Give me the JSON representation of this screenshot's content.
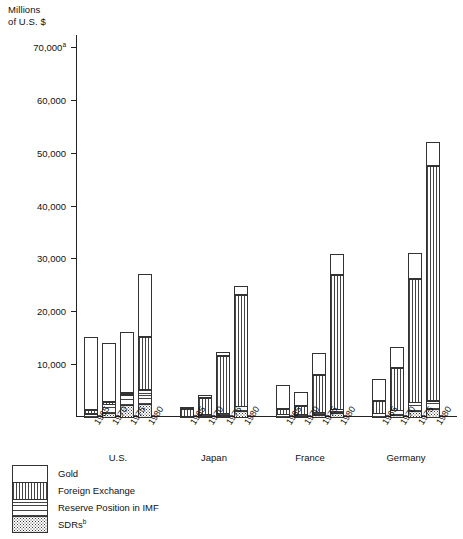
{
  "chart_data": {
    "type": "bar",
    "subtype": "stacked-grouped",
    "title": "",
    "ylabel": "Millions\nof U.S. $",
    "xlabel": "",
    "ylim": [
      0,
      70000
    ],
    "ytick_labels": [
      "70,000",
      "60,000",
      "50,000",
      "40,000",
      "30,000",
      "20,000",
      "10,000"
    ],
    "ytick_values": [
      70000,
      60000,
      50000,
      40000,
      30000,
      20000,
      10000
    ],
    "ytick_footnote": "a",
    "grid": false,
    "legend_position": "below-left",
    "categories": [
      "U.S.",
      "Japan",
      "France",
      "Germany",
      "U.K."
    ],
    "years": [
      "1965",
      "1970",
      "1975",
      "1980"
    ],
    "series": [
      {
        "name": "Gold",
        "pattern": "solid-white"
      },
      {
        "name": "Foreign Exchange",
        "pattern": "vertical-lines"
      },
      {
        "name": "Reserve Position in IMF",
        "pattern": "horizontal-lines"
      },
      {
        "name": "SDRs",
        "pattern": "dotted",
        "footnote": "b"
      }
    ],
    "groups": [
      {
        "country": "U.S.",
        "bars": [
          {
            "year": "1965",
            "total": 15450,
            "segments": {
              "SDRs": 0,
              "Reserve Position in IMF": 800,
              "Foreign Exchange": 750,
              "Gold": 13900
            }
          },
          {
            "year": "1970",
            "total": 14490,
            "segments": {
              "SDRs": 850,
              "Reserve Position in IMF": 1900,
              "Foreign Exchange": 600,
              "Gold": 11140
            }
          },
          {
            "year": "1975",
            "total": 16230,
            "segments": {
              "SDRs": 2340,
              "Reserve Position in IMF": 2200,
              "Foreign Exchange": 100,
              "Gold": 11590
            }
          },
          {
            "year": "1980",
            "total": 27400,
            "segments": {
              "SDRs": 2610,
              "Reserve Position in IMF": 2850,
              "Foreign Exchange": 10100,
              "Gold": 11840
            }
          }
        ]
      },
      {
        "country": "Japan",
        "bars": [
          {
            "year": "1965",
            "total": 2110,
            "segments": {
              "SDRs": 0,
              "Reserve Position in IMF": 280,
              "Foreign Exchange": 1500,
              "Gold": 330
            }
          },
          {
            "year": "1970",
            "total": 4400,
            "segments": {
              "SDRs": 120,
              "Reserve Position in IMF": 500,
              "Foreign Exchange": 3200,
              "Gold": 580
            }
          },
          {
            "year": "1975",
            "total": 12820,
            "segments": {
              "SDRs": 420,
              "Reserve Position in IMF": 660,
              "Foreign Exchange": 10900,
              "Gold": 840
            }
          },
          {
            "year": "1980",
            "total": 25230,
            "segments": {
              "SDRs": 1220,
              "Reserve Position in IMF": 1100,
              "Foreign Exchange": 21100,
              "Gold": 1810
            }
          }
        ]
      },
      {
        "country": "France",
        "bars": [
          {
            "year": "1965",
            "total": 6340,
            "segments": {
              "SDRs": 0,
              "Reserve Position in IMF": 700,
              "Foreign Exchange": 1140,
              "Gold": 4500
            }
          },
          {
            "year": "1970",
            "total": 4960,
            "segments": {
              "SDRs": 190,
              "Reserve Position in IMF": 450,
              "Foreign Exchange": 1700,
              "Gold": 2620
            }
          },
          {
            "year": "1975",
            "total": 12630,
            "segments": {
              "SDRs": 600,
              "Reserve Position in IMF": 620,
              "Foreign Exchange": 7210,
              "Gold": 4200
            }
          },
          {
            "year": "1980",
            "total": 31300,
            "segments": {
              "SDRs": 960,
              "Reserve Position in IMF": 830,
              "Foreign Exchange": 25510,
              "Gold": 4000
            }
          }
        ]
      },
      {
        "country": "Germany",
        "bars": [
          {
            "year": "1965",
            "total": 7430,
            "segments": {
              "SDRs": 0,
              "Reserve Position in IMF": 850,
              "Foreign Exchange": 2480,
              "Gold": 4100
            }
          },
          {
            "year": "1970",
            "total": 13610,
            "segments": {
              "SDRs": 540,
              "Reserve Position in IMF": 1010,
              "Foreign Exchange": 8060,
              "Gold": 4000
            }
          },
          {
            "year": "1975",
            "total": 31400,
            "segments": {
              "SDRs": 1290,
              "Reserve Position in IMF": 1780,
              "Foreign Exchange": 23430,
              "Gold": 4900
            }
          },
          {
            "year": "1980",
            "total": 52500,
            "segments": {
              "SDRs": 1640,
              "Reserve Position in IMF": 1760,
              "Foreign Exchange": 44600,
              "Gold": 4500
            }
          }
        ]
      },
      {
        "country": "U.K.",
        "bars": [
          {
            "year": "1965",
            "total": 3000,
            "segments": {
              "SDRs": 0,
              "Reserve Position in IMF": 260,
              "Foreign Exchange": 1280,
              "Gold": 1460
            }
          },
          {
            "year": "1970",
            "total": 2830,
            "segments": {
              "SDRs": 170,
              "Reserve Position in IMF": 0,
              "Foreign Exchange": 1750,
              "Gold": 910
            }
          },
          {
            "year": "1975",
            "total": 5430,
            "segments": {
              "SDRs": 410,
              "Reserve Position in IMF": 220,
              "Foreign Exchange": 4000,
              "Gold": 800
            }
          },
          {
            "year": "1980",
            "total": 21490,
            "segments": {
              "SDRs": 700,
              "Reserve Position in IMF": 1400,
              "Foreign Exchange": 18100,
              "Gold": 1290
            }
          }
        ]
      }
    ]
  },
  "legend": {
    "items": [
      {
        "label": "Gold",
        "note": ""
      },
      {
        "label": "Foreign Exchange",
        "note": ""
      },
      {
        "label": "Reserve Position in IMF",
        "note": ""
      },
      {
        "label": "SDRs",
        "note": "b"
      }
    ]
  }
}
